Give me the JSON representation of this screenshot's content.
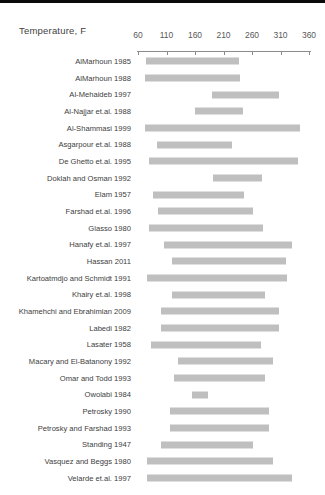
{
  "page": {
    "top_edge_bar_color": "#0a0a0a",
    "background_color": "#ffffff"
  },
  "chart_data": {
    "type": "bar",
    "subtype": "horizontal-range",
    "title": "Temperature, F",
    "xlabel": "Temperature, F",
    "ylabel": "",
    "xlim": [
      60,
      360
    ],
    "xticks": [
      60,
      110,
      160,
      210,
      260,
      310,
      360
    ],
    "grid": false,
    "legend_position": "none",
    "axis_position": "top",
    "bar_color": "#bfbfbf",
    "categories": [
      "AlMarhoun 1985",
      "AlMarhoun 1988",
      "Al-Mehaideb 1997",
      "Al-Najjar et.al. 1988",
      "Al-Shammasi 1999",
      "Asgarpour et.al. 1988",
      "De Ghetto et.al. 1995",
      "Doklah and Osman 1992",
      "Elam 1957",
      "Farshad et.al. 1996",
      "Glasso 1980",
      "Hanafy et.al. 1997",
      "Hassan 2011",
      "Kartoatmdjo and Schmidt 1991",
      "Khairy et.al. 1998",
      "Khamehchi and Ebrahimian 2009",
      "Labedi 1982",
      "Lasater 1958",
      "Macary and El-Batanony 1992",
      "Omar and Todd 1993",
      "Owolabi 1984",
      "Petrosky 1990",
      "Petrosky and Farshad 1993",
      "Standing 1947",
      "Vasquez and Beggs 1980",
      "Velarde et.al. 1997"
    ],
    "ranges": [
      [
        74,
        238
      ],
      [
        72,
        239
      ],
      [
        190,
        307
      ],
      [
        160,
        244
      ],
      [
        72,
        344
      ],
      [
        93,
        225
      ],
      [
        79,
        341
      ],
      [
        192,
        278
      ],
      [
        86,
        246
      ],
      [
        95,
        262
      ],
      [
        79,
        279
      ],
      [
        106,
        330
      ],
      [
        120,
        320
      ],
      [
        76,
        321
      ],
      [
        120,
        283
      ],
      [
        100,
        307
      ],
      [
        100,
        307
      ],
      [
        83,
        276
      ],
      [
        130,
        296
      ],
      [
        123,
        283
      ],
      [
        155,
        183
      ],
      [
        116,
        290
      ],
      [
        116,
        290
      ],
      [
        100,
        262
      ],
      [
        76,
        297
      ],
      [
        76,
        330
      ]
    ]
  }
}
